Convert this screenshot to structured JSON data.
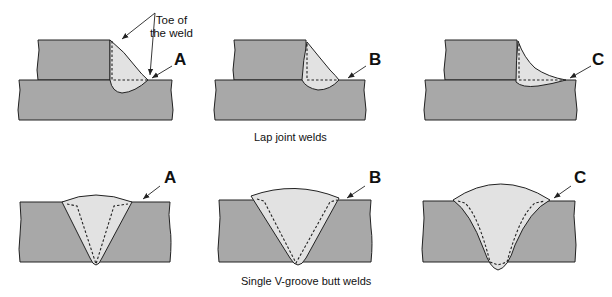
{
  "figure": {
    "lap_section": {
      "caption": "Lap joint welds",
      "annotation": "Toe of\nthe weld",
      "annotation_line1": "Toe of",
      "annotation_line2": "the weld",
      "panels": [
        {
          "label": "A"
        },
        {
          "label": "B"
        },
        {
          "label": "C"
        }
      ]
    },
    "groove_section": {
      "caption": "Single V-groove butt welds",
      "panels": [
        {
          "label": "A"
        },
        {
          "label": "B"
        },
        {
          "label": "C"
        }
      ]
    },
    "colors": {
      "base_metal": "#a8a8a8",
      "weld_metal": "#e2e2e2",
      "outline": "#222222",
      "background": "#ffffff"
    }
  }
}
